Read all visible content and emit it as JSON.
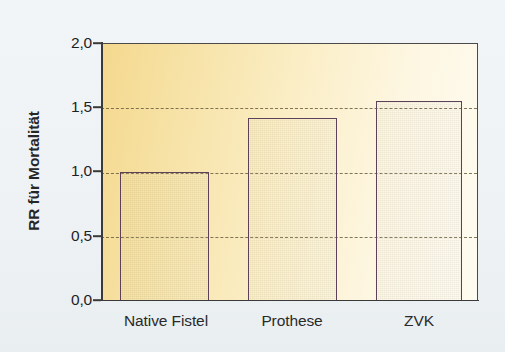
{
  "chart_data": {
    "type": "bar",
    "title": "",
    "subtitle": "",
    "xlabel": "",
    "ylabel": "RR für Mortalität",
    "categories": [
      "Native Fistel",
      "Prothese",
      "ZVK"
    ],
    "values": [
      1.0,
      1.42,
      1.55
    ],
    "ylim": [
      0.0,
      2.0
    ],
    "ytick_values": [
      2.0,
      1.5,
      1.0,
      0.5,
      0.0
    ],
    "ytick_labels": [
      "2,0",
      "1,5",
      "1,0",
      "0,5",
      "0,0"
    ],
    "grid": true,
    "gridlines_at": [
      1.5,
      1.0,
      0.5
    ],
    "legend": null,
    "legend_position": "none",
    "annotations": [],
    "series": [
      {
        "name": "RR für Mortalität",
        "values": [
          1.0,
          1.42,
          1.55
        ]
      }
    ]
  },
  "style": {
    "page_background": "#eef2f5",
    "plot_background_left": "#f4d88e",
    "plot_background_right": "#fefbf0",
    "bar_edge_color": "#5d4159",
    "bar_dark_color": "#7e4f7e",
    "bar_light_color": "#e9d6ea",
    "axis_color": "#3a3a3a",
    "gridline_color": "#6b5f3f",
    "text_color": "#1f1f1f"
  }
}
